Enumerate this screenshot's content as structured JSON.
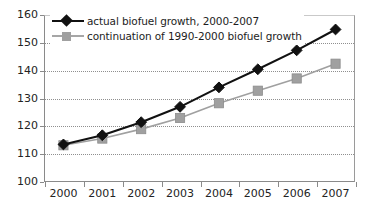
{
  "chart_data": {
    "type": "line",
    "title": "",
    "xlabel": "",
    "ylabel": "",
    "categories": [
      "2000",
      "2001",
      "2002",
      "2003",
      "2004",
      "2005",
      "2006",
      "2007"
    ],
    "ylim": [
      100,
      160
    ],
    "yticks": [
      100,
      110,
      120,
      130,
      140,
      150,
      160
    ],
    "grid": true,
    "legend_position": "top-left",
    "series": [
      {
        "name": "actual biofuel growth, 2000-2007",
        "marker": "diamond",
        "color": "#111111",
        "values": [
          113.5,
          116.8,
          121.5,
          127.0,
          134.0,
          140.5,
          147.3,
          154.8
        ]
      },
      {
        "name": "continuation of 1990-2000 biofuel growth",
        "marker": "square",
        "color": "#a0a0a0",
        "values": [
          113.2,
          115.6,
          119.0,
          123.0,
          128.3,
          132.8,
          137.2,
          142.5
        ]
      }
    ]
  },
  "legend": {
    "items": [
      {
        "label": "actual biofuel growth, 2000-2007"
      },
      {
        "label": "continuation of 1990-2000 biofuel growth"
      }
    ]
  },
  "axes": {
    "y_tick_labels": [
      "160",
      "150",
      "140",
      "130",
      "120",
      "110",
      "100"
    ],
    "x_tick_labels": [
      "2000",
      "2001",
      "2002",
      "2003",
      "2004",
      "2005",
      "2006",
      "2007"
    ]
  }
}
